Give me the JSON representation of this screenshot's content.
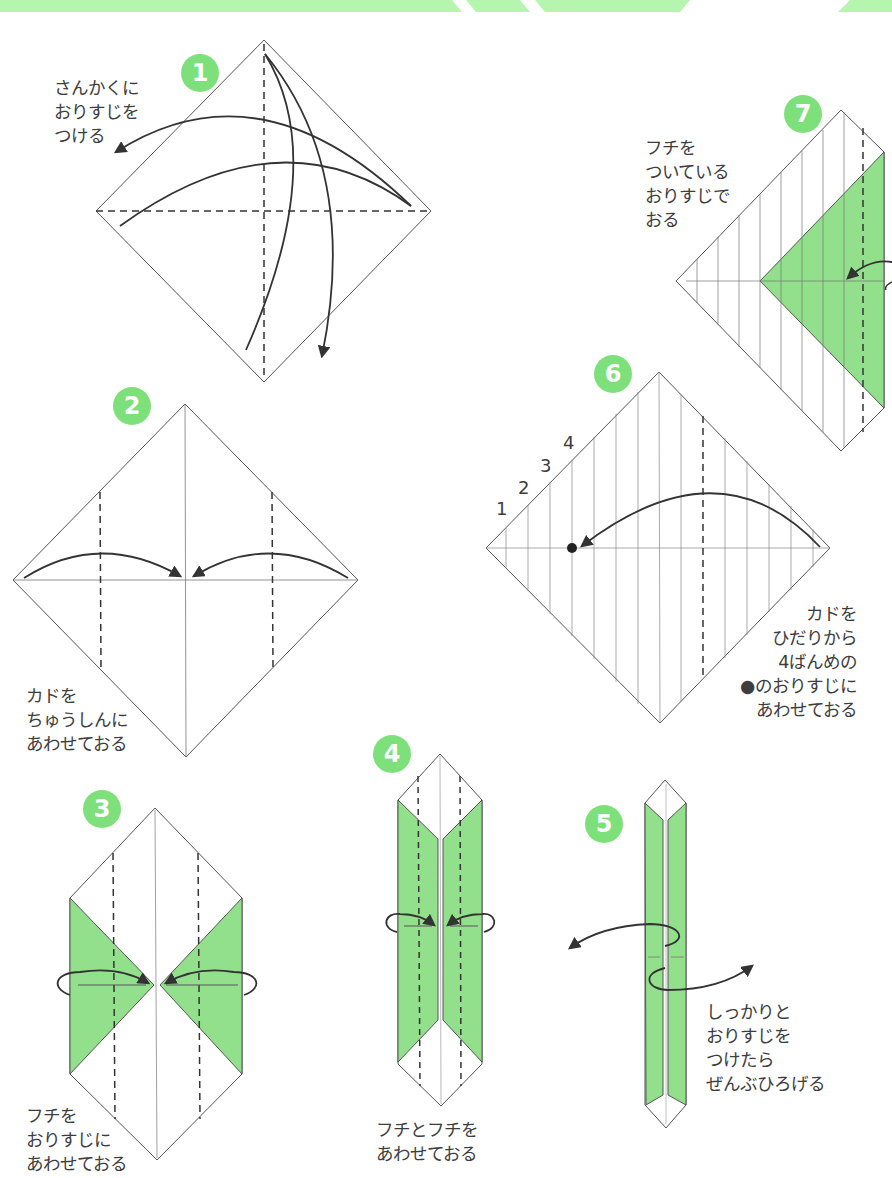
{
  "header": {
    "banner_color": "#b6f5b0"
  },
  "colors": {
    "paper_green": "#92e08c",
    "badge_green": "#7ee07a",
    "line": "#3a3a3a"
  },
  "steps": [
    {
      "number": "1",
      "instruction": "さんかくに\nおりすじを\nつける"
    },
    {
      "number": "2",
      "instruction": "カドを\nちゅうしんに\nあわせておる"
    },
    {
      "number": "3",
      "instruction": "フチを\nおりすじに\nあわせておる"
    },
    {
      "number": "4",
      "instruction": "フチとフチを\nあわせておる"
    },
    {
      "number": "5",
      "instruction": "しっかりと\nおりすじを\nつけたら\nぜんぶひろげる"
    },
    {
      "number": "6",
      "instruction": "カドを\nひだりから\n4ばんめの\n●のおりすじに\nあわせておる",
      "crease_labels": [
        "1",
        "2",
        "3",
        "4"
      ]
    },
    {
      "number": "7",
      "instruction": "フチを\nついている\nおりすじで\nおる"
    }
  ]
}
